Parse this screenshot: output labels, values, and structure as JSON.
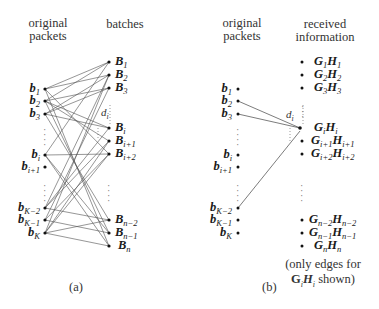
{
  "panel_a": {
    "header_left": "original packets",
    "header_left_lines": [
      "original",
      "packets"
    ],
    "header_right": "batches",
    "caption": "(a)",
    "degree_label": "d",
    "degree_sub": "i",
    "left_nodes": [
      {
        "base": "b",
        "sub": "1"
      },
      {
        "base": "b",
        "sub": "2"
      },
      {
        "base": "b",
        "sub": "3"
      },
      {
        "base": "b",
        "sub": "i"
      },
      {
        "base": "b",
        "sub": "i+1"
      },
      {
        "base": "b",
        "sub": "K−2"
      },
      {
        "base": "b",
        "sub": "K−1"
      },
      {
        "base": "b",
        "sub": "K"
      }
    ],
    "right_nodes": [
      {
        "base": "B",
        "sub": "1"
      },
      {
        "base": "B",
        "sub": "2"
      },
      {
        "base": "B",
        "sub": "3"
      },
      {
        "base": "B",
        "sub": "i"
      },
      {
        "base": "B",
        "sub": "i+1"
      },
      {
        "base": "B",
        "sub": "i+2"
      },
      {
        "base": "B",
        "sub": "n−2"
      },
      {
        "base": "B",
        "sub": "n−1"
      },
      {
        "base": "B",
        "sub": "n"
      }
    ]
  },
  "panel_b": {
    "header_left_lines": [
      "original",
      "packets"
    ],
    "header_right_lines": [
      "received",
      "information"
    ],
    "caption": "(b)",
    "degree_label": "d",
    "degree_sub": "i",
    "note_lines": [
      "(only edges for",
      "G_iH_i shown)"
    ],
    "note_line1": "(only edges for",
    "note_line2_suffix": " shown)",
    "left_nodes": [
      {
        "base": "b",
        "sub": "1"
      },
      {
        "base": "b",
        "sub": "2"
      },
      {
        "base": "b",
        "sub": "3"
      },
      {
        "base": "b",
        "sub": "i"
      },
      {
        "base": "b",
        "sub": "i+1"
      },
      {
        "base": "b",
        "sub": "K−2"
      },
      {
        "base": "b",
        "sub": "K−1"
      },
      {
        "base": "b",
        "sub": "K"
      }
    ],
    "right_nodes": [
      {
        "g": "1",
        "h": "1"
      },
      {
        "g": "2",
        "h": "2"
      },
      {
        "g": "3",
        "h": "3"
      },
      {
        "g": "i",
        "h": "i"
      },
      {
        "g": "i+1",
        "h": "i+1"
      },
      {
        "g": "i+2",
        "h": "i+2"
      },
      {
        "g": "n−2",
        "h": "n−2"
      },
      {
        "g": "n−1",
        "h": "n−1"
      },
      {
        "g": "n",
        "h": "n"
      }
    ],
    "edges_to_GiHi_from": [
      "b_2",
      "b_3",
      "b_K−2"
    ]
  }
}
